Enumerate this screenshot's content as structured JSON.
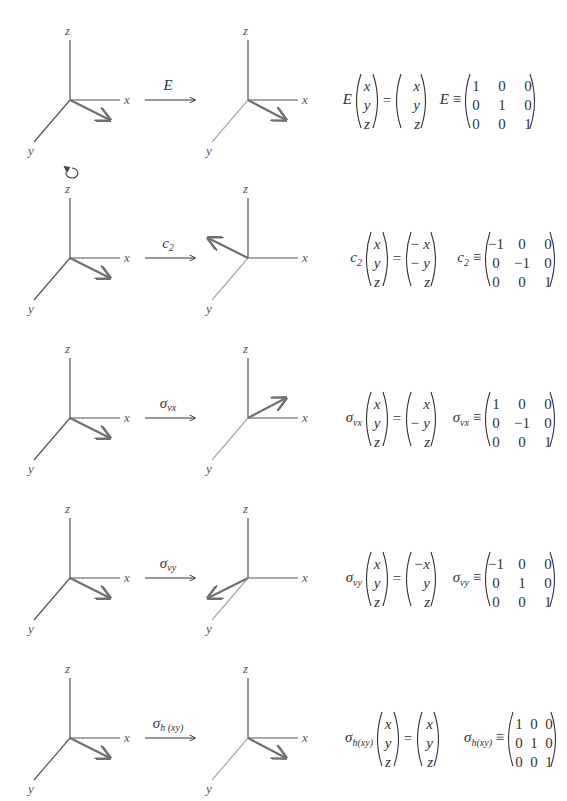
{
  "axes_labels": {
    "x": "x",
    "y": "y",
    "z": "z"
  },
  "colors": {
    "axis_dark": "#555555",
    "axis_light": "#aaaaaa",
    "vector": "#707070",
    "text": "#333333"
  },
  "rows": [
    {
      "operation": "E",
      "op_sub": "",
      "has_rotation_icon": false,
      "eq_lhs_symbol": "E",
      "eq_lhs_sub": "",
      "input_vector": [
        "x",
        "y",
        "z"
      ],
      "output_vector": [
        "x",
        "y",
        "z"
      ],
      "matrix_symbol": "E",
      "matrix_sub": "",
      "equiv": "≡",
      "matrix": [
        [
          "1",
          "0",
          "0"
        ],
        [
          "0",
          "1",
          "0"
        ],
        [
          "0",
          "0",
          "1"
        ]
      ]
    },
    {
      "operation": "c",
      "op_sub": "2",
      "has_rotation_icon": true,
      "eq_lhs_symbol": "c",
      "eq_lhs_sub": "2",
      "input_vector": [
        "x",
        "y",
        "z"
      ],
      "output_vector": [
        "− x",
        "− y",
        "z"
      ],
      "matrix_symbol": "c",
      "matrix_sub": "2",
      "equiv": "≡",
      "matrix": [
        [
          "−1",
          "0",
          "0"
        ],
        [
          "0",
          "−1",
          "0"
        ],
        [
          "0",
          "0",
          "1"
        ]
      ]
    },
    {
      "operation": "σ",
      "op_sub": "vx",
      "has_rotation_icon": false,
      "eq_lhs_symbol": "σ",
      "eq_lhs_sub": "vx",
      "input_vector": [
        "x",
        "y",
        "z"
      ],
      "output_vector": [
        "x",
        "− y",
        "z"
      ],
      "matrix_symbol": "σ",
      "matrix_sub": "vx",
      "equiv": "≡",
      "matrix": [
        [
          "1",
          "0",
          "0"
        ],
        [
          "0",
          "−1",
          "0"
        ],
        [
          "0",
          "0",
          "1"
        ]
      ]
    },
    {
      "operation": "σ",
      "op_sub": "vy",
      "has_rotation_icon": false,
      "eq_lhs_symbol": "σ",
      "eq_lhs_sub": "vy",
      "input_vector": [
        "x",
        "y",
        "z"
      ],
      "output_vector": [
        "−x",
        "y",
        "z"
      ],
      "matrix_symbol": "σ",
      "matrix_sub": "vy",
      "equiv": "≡",
      "matrix": [
        [
          "−1",
          "0",
          "0"
        ],
        [
          "0",
          "1",
          "0"
        ],
        [
          "0",
          "0",
          "1"
        ]
      ]
    },
    {
      "operation": "σ",
      "op_sub": "h (xy)",
      "has_rotation_icon": false,
      "eq_lhs_symbol": "σ",
      "eq_lhs_sub": "h(xy)",
      "input_vector": [
        "x",
        "y",
        "z"
      ],
      "output_vector": [
        "x",
        "y",
        "z"
      ],
      "matrix_symbol": "σ",
      "matrix_sub": "h(xy)",
      "equiv": "≡",
      "matrix": [
        [
          "1",
          "0",
          "0"
        ],
        [
          "0",
          "1",
          "0"
        ],
        [
          "0",
          "0",
          "1"
        ]
      ]
    }
  ]
}
